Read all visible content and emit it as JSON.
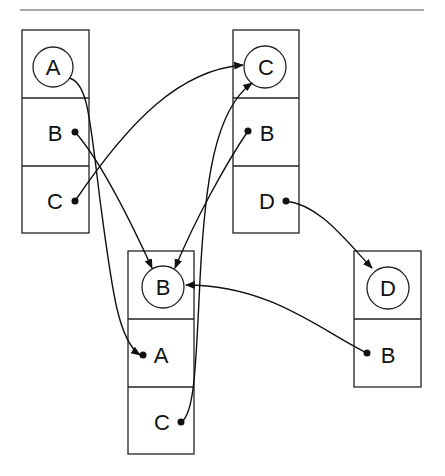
{
  "diagram": {
    "type": "pointer-structure",
    "nodes": [
      {
        "id": "A",
        "label": "A",
        "fields": [
          "B",
          "C"
        ]
      },
      {
        "id": "C",
        "label": "C",
        "fields": [
          "B",
          "D"
        ]
      },
      {
        "id": "B",
        "label": "B",
        "fields": [
          "A",
          "C"
        ]
      },
      {
        "id": "D",
        "label": "D",
        "fields": [
          "B"
        ]
      }
    ],
    "edges": [
      {
        "from": "A.B",
        "to": "B"
      },
      {
        "from": "A.C",
        "to": "C"
      },
      {
        "from": "C.B",
        "to": "B"
      },
      {
        "from": "C.D",
        "to": "D"
      },
      {
        "from": "B.A",
        "to": "A"
      },
      {
        "from": "B.C",
        "to": "C"
      },
      {
        "from": "D.B",
        "to": "B"
      }
    ]
  },
  "labels": {
    "nodeA": {
      "head": "A",
      "f1": "B",
      "f2": "C"
    },
    "nodeC": {
      "head": "C",
      "f1": "B",
      "f2": "D"
    },
    "nodeB": {
      "head": "B",
      "f1": "A",
      "f2": "C"
    },
    "nodeD": {
      "head": "D",
      "f1": "B"
    }
  }
}
